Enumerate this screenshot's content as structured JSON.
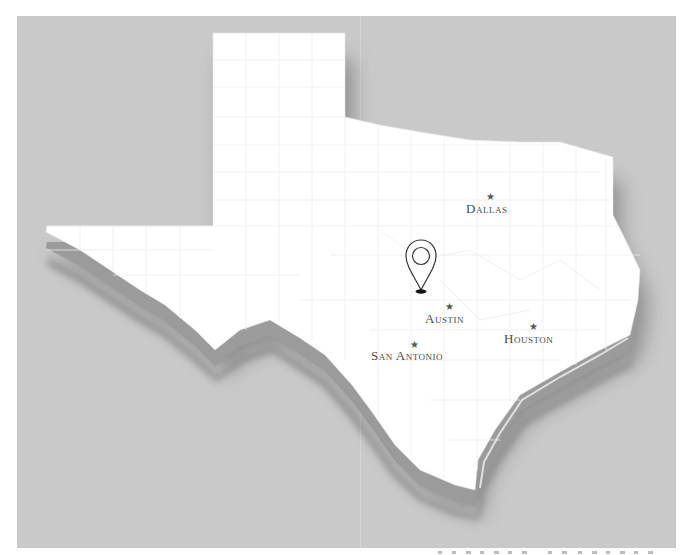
{
  "map": {
    "subject": "Texas",
    "style": "3D extruded white state with county lines on gray textured background",
    "colors": {
      "background_frame": "#c9c9c9",
      "land": "#ffffff",
      "extrusion": "#9a9a9a",
      "shadow": "#8a8a8a",
      "county_lines": "#ececec",
      "label": "#4a4a4a",
      "pin_outline": "#333333",
      "pin_base": "#111111"
    },
    "cities": [
      {
        "name": "Dallas",
        "label": "Dallas",
        "x": 490,
        "y": 196,
        "label_x": 466,
        "label_y": 213
      },
      {
        "name": "Austin",
        "label": "Austin",
        "x": 449,
        "y": 306,
        "label_x": 425,
        "label_y": 323
      },
      {
        "name": "San Antonio",
        "label": "San Antonio",
        "x": 414,
        "y": 344,
        "label_x": 371,
        "label_y": 360
      },
      {
        "name": "Houston",
        "label": "Houston",
        "x": 533,
        "y": 326,
        "label_x": 504,
        "label_y": 343
      }
    ],
    "pin": {
      "icon": "location-pin-icon",
      "x": 421,
      "y": 240
    }
  }
}
